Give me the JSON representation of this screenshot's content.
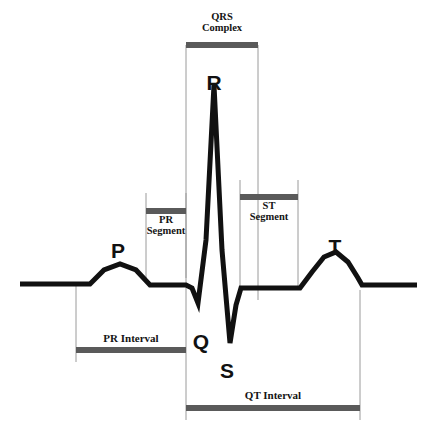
{
  "diagram": {
    "canvas": {
      "width": 435,
      "height": 445
    },
    "colors": {
      "trace": "#111111",
      "background": "#ffffff",
      "guide_line": "#9a9a9a",
      "annotation_bar": "#5a5a5a",
      "label_text": "#141414"
    }
  },
  "wave_labels": [
    {
      "id": "p",
      "text": "P",
      "x": 118,
      "y": 240,
      "font_size": 21
    },
    {
      "id": "q",
      "text": "Q",
      "x": 201,
      "y": 331,
      "font_size": 21
    },
    {
      "id": "r",
      "text": "R",
      "x": 214,
      "y": 72,
      "font_size": 21
    },
    {
      "id": "s",
      "text": "S",
      "x": 227,
      "y": 360,
      "font_size": 21
    },
    {
      "id": "t",
      "text": "T",
      "x": 335,
      "y": 236,
      "font_size": 21
    }
  ],
  "annotations": [
    {
      "id": "qrs-complex",
      "lines": [
        "QRS",
        "Complex"
      ],
      "bar": {
        "x1": 186,
        "x2": 258,
        "y": 45
      },
      "text_y": 12,
      "text_position": "above",
      "guides": [
        {
          "x": 186,
          "y1": 45,
          "y2": 300
        },
        {
          "x": 258,
          "y1": 45,
          "y2": 300
        }
      ]
    },
    {
      "id": "pr-segment",
      "lines": [
        "PR",
        "Segment"
      ],
      "bar": {
        "x1": 146,
        "x2": 186,
        "y": 211
      },
      "text_y": 215,
      "text_position": "below",
      "guides": [
        {
          "x": 146,
          "y1": 193,
          "y2": 278
        },
        {
          "x": 186,
          "y1": 193,
          "y2": 278
        }
      ]
    },
    {
      "id": "st-segment",
      "lines": [
        "ST",
        "Segment"
      ],
      "bar": {
        "x1": 240,
        "x2": 298,
        "y": 197
      },
      "text_y": 201,
      "text_position": "below",
      "guides": [
        {
          "x": 240,
          "y1": 180,
          "y2": 290
        },
        {
          "x": 298,
          "y1": 180,
          "y2": 290
        }
      ]
    },
    {
      "id": "pr-interval",
      "lines": [
        "PR Interval"
      ],
      "bar": {
        "x1": 76,
        "x2": 186,
        "y": 350
      },
      "text_y": 333,
      "text_position": "above",
      "guides": [
        {
          "x": 76,
          "y1": 284,
          "y2": 362
        },
        {
          "x": 186,
          "y1": 300,
          "y2": 362
        }
      ]
    },
    {
      "id": "qt-interval",
      "lines": [
        "QT Interval"
      ],
      "bar": {
        "x1": 186,
        "x2": 360,
        "y": 408
      },
      "text_y": 390,
      "text_position": "above",
      "guides": [
        {
          "x": 186,
          "y1": 362,
          "y2": 420
        },
        {
          "x": 360,
          "y1": 290,
          "y2": 420
        }
      ]
    }
  ],
  "chart_data": {
    "type": "line",
    "xlabel": "",
    "ylabel": "",
    "grid": false,
    "legend": "none",
    "baseline_y": 284,
    "trace_width": 5,
    "xlim": [
      0,
      435
    ],
    "ylim": [
      445,
      0
    ],
    "points": [
      [
        20,
        284
      ],
      [
        90,
        284
      ],
      [
        104,
        270
      ],
      [
        120,
        264
      ],
      [
        136,
        270
      ],
      [
        150,
        285
      ],
      [
        186,
        285
      ],
      [
        192,
        288
      ],
      [
        198,
        303
      ],
      [
        206,
        240
      ],
      [
        214,
        85
      ],
      [
        222,
        250
      ],
      [
        230,
        343
      ],
      [
        236,
        305
      ],
      [
        241,
        288
      ],
      [
        300,
        288
      ],
      [
        312,
        272
      ],
      [
        324,
        257
      ],
      [
        336,
        252
      ],
      [
        348,
        262
      ],
      [
        358,
        278
      ],
      [
        362,
        285
      ],
      [
        417,
        285
      ]
    ],
    "feature_points": [
      {
        "name": "P peak",
        "x": 120,
        "y": 264
      },
      {
        "name": "Q trough",
        "x": 198,
        "y": 303
      },
      {
        "name": "R peak",
        "x": 214,
        "y": 85
      },
      {
        "name": "S trough",
        "x": 230,
        "y": 343
      },
      {
        "name": "T peak",
        "x": 336,
        "y": 252
      }
    ]
  }
}
